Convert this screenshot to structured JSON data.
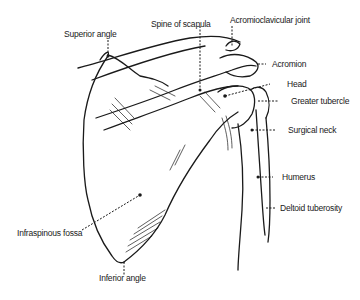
{
  "diagram": {
    "labels": {
      "superior_angle": "Superior angle",
      "spine_of_scapula": "Spine of scapula",
      "acromioclavicular_joint": "Acromioclavicular joint",
      "acromion": "Acromion",
      "head": "Head",
      "greater_tubercle": "Greater tubercle",
      "surgical_neck": "Surgical neck",
      "humerus": "Humerus",
      "deltoid_tuberosity": "Deltoid tuberosity",
      "infraspinous_fossa": "Infraspinous fossa",
      "inferior_angle": "Inferior angle"
    },
    "colors": {
      "ink": "#1a1a1a",
      "background": "#ffffff"
    }
  }
}
